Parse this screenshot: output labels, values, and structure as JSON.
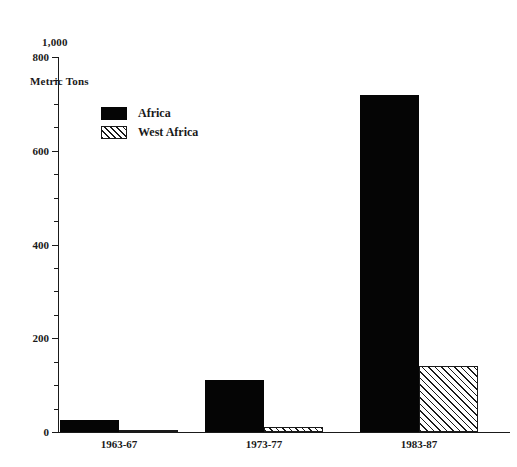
{
  "chart_data": {
    "type": "bar",
    "title": "",
    "subtitle": "",
    "unit_caption_line1": "1,000",
    "unit_caption_line2": "Metric Tons",
    "xlabel": "",
    "ylabel": "1,000 Metric Tons",
    "categories": [
      "1963-67",
      "1973-77",
      "1983-87"
    ],
    "series": [
      {
        "name": "Africa",
        "pattern": "solid-black",
        "values": [
          25,
          110,
          720
        ]
      },
      {
        "name": "West Africa",
        "pattern": "diagonal-hatch",
        "values": [
          3,
          10,
          140
        ]
      }
    ],
    "ylim": [
      0,
      800
    ],
    "ytick_values": [
      0,
      200,
      400,
      600,
      800
    ],
    "ytick_labels": [
      "0",
      "200",
      "400",
      "600",
      "800"
    ],
    "yminor_step": 50,
    "grid": false,
    "legend_position": "upper-left-inside",
    "colors": {
      "series_africa": "#050505",
      "series_west_africa": "#ffffff",
      "hatch_line": "#1a1a1a",
      "axis": "#1a1a1a",
      "background": "#ffffff"
    }
  }
}
